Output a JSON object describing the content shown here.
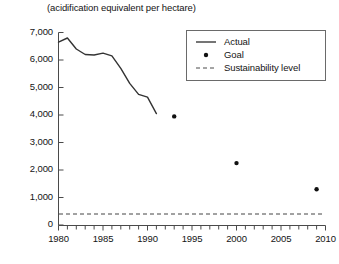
{
  "chart_data": {
    "type": "line",
    "title": "(acidification equivalent per hectare)",
    "xlabel": "",
    "ylabel": "",
    "xlim": [
      1980,
      2010
    ],
    "ylim": [
      0,
      7000
    ],
    "grid": false,
    "legend_position": "top-right",
    "x_ticks_major": [
      1980,
      1985,
      1990,
      1995,
      2000,
      2005,
      2010
    ],
    "x_tick_labels": [
      "1980",
      "1985",
      "1990",
      "1995",
      "2000",
      "2005",
      "2010"
    ],
    "x_minor_tick_interval": 1,
    "y_ticks": [
      0,
      1000,
      2000,
      3000,
      4000,
      5000,
      6000,
      7000
    ],
    "y_tick_labels": [
      "0",
      "1,000",
      "2,000",
      "3,000",
      "4,000",
      "5,000",
      "6,000",
      "7,000"
    ],
    "series": [
      {
        "name": "Actual",
        "type": "line",
        "style": "solid",
        "color": "#333333",
        "x": [
          1980,
          1981,
          1982,
          1983,
          1984,
          1985,
          1986,
          1987,
          1988,
          1989,
          1990,
          1991
        ],
        "values": [
          6650,
          6800,
          6400,
          6200,
          6180,
          6250,
          6150,
          5700,
          5150,
          4750,
          4650,
          4050
        ]
      },
      {
        "name": "Goal",
        "type": "scatter",
        "style": "dot",
        "color": "#111111",
        "x": [
          1993,
          2000,
          2009
        ],
        "values": [
          3950,
          2250,
          1300
        ]
      },
      {
        "name": "Sustainability level",
        "type": "hline",
        "style": "dashed",
        "color": "#444444",
        "value": 400
      }
    ],
    "legend": [
      {
        "label": "Actual",
        "marker": "line-solid"
      },
      {
        "label": "Goal",
        "marker": "dot"
      },
      {
        "label": "Sustainability level",
        "marker": "line-dashed"
      }
    ]
  },
  "axes": {
    "y_labels": [
      "7,000",
      "6,000",
      "5,000",
      "4,000",
      "3,000",
      "2,000",
      "1,000",
      "0"
    ],
    "x_labels": [
      "1980",
      "1985",
      "1990",
      "1995",
      "2000",
      "2005",
      "2010"
    ]
  },
  "legend": {
    "actual": "Actual",
    "goal": "Goal",
    "sustainability": "Sustainability level"
  },
  "title": "(acidification equivalent per hectare)"
}
